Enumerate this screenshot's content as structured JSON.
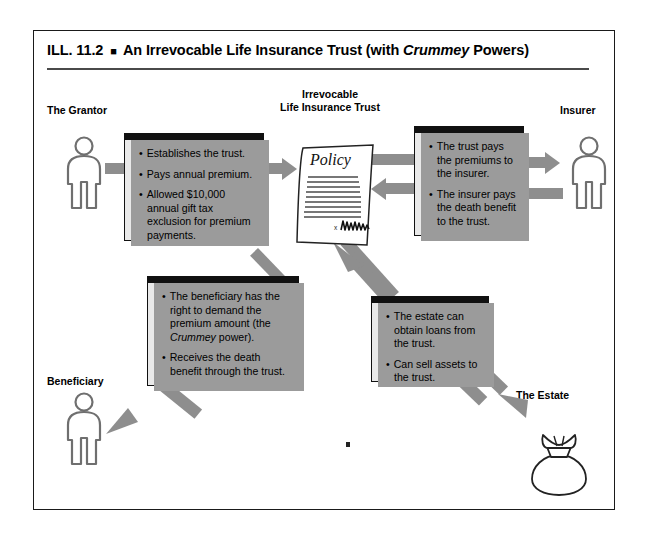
{
  "figure": {
    "number_label": "ILL. 11.2",
    "separator_glyph": "■",
    "title_before_italic": "An Irrevocable Life Insurance Trust (with ",
    "title_italic_word": "Crummey",
    "title_after_italic": " Powers)",
    "full_title": "ILL. 11.2 ■ An Irrevocable Life Insurance Trust (with Crummey Powers)"
  },
  "actors": {
    "grantor": {
      "label": "The Grantor"
    },
    "trust": {
      "label_line1": "Irrevocable",
      "label_line2": "Life Insurance Trust"
    },
    "insurer": {
      "label": "Insurer"
    },
    "beneficiary": {
      "label": "Beneficiary"
    },
    "estate": {
      "label": "The Estate"
    }
  },
  "policy_document": {
    "heading": "Policy",
    "signature_mark": "x",
    "rule_line_count": 9
  },
  "boxes": {
    "grantor_box": {
      "name": "grantor-duties",
      "items": [
        "Establishes the trust.",
        "Pays annual premium.",
        "Allowed $10,000 annual gift tax exclusion for premium payments."
      ]
    },
    "insurer_box": {
      "name": "trust-insurer-flows",
      "items": [
        "The trust pays the premiums to the insurer.",
        "The insurer pays the death benefit to the trust."
      ]
    },
    "beneficiary_box": {
      "name": "beneficiary-rights",
      "item1_part1": "The beneficiary has the right to demand the premium amount (the ",
      "item1_italic": "Crummey",
      "item1_part2": " power).",
      "item2": "Receives the death benefit through the trust."
    },
    "estate_box": {
      "name": "estate-transactions",
      "items": [
        "The estate can obtain loans from the trust.",
        "Can sell assets to the trust."
      ]
    }
  },
  "colors": {
    "frame_border": "#1a1a1a",
    "box_fill": "#e9e9e9",
    "box_border": "#111111",
    "box_topbar": "#111111",
    "box_shadow": "#9b9b9b",
    "connector_gray": "#8e8e8e",
    "figure_outline": "#6f6f6f",
    "page_background": "#ffffff",
    "title_rule": "#4a4a4a"
  }
}
